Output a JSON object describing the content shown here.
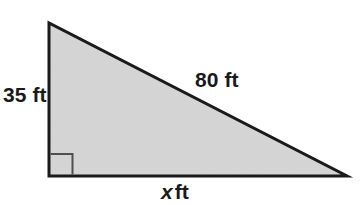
{
  "figure": {
    "type": "right-triangle-diagram",
    "labels": {
      "vertical_leg": "35 ft",
      "hypotenuse": "80 ft",
      "horizontal_leg_variable": "x",
      "horizontal_leg_unit": "ft"
    },
    "colors": {
      "fill": "#d6d6d6",
      "stroke": "#1a1a1a",
      "right_angle_stroke": "#4f4f4f",
      "background": "#ffffff",
      "text": "#1a1a1a"
    },
    "geometry": {
      "apex": [
        49,
        23
      ],
      "bottom_left": [
        49,
        176
      ],
      "bottom_right": [
        347,
        176
      ],
      "stroke_width": 3,
      "right_angle_marker_size": 22,
      "right_angle_marker_stroke_width": 2
    }
  }
}
